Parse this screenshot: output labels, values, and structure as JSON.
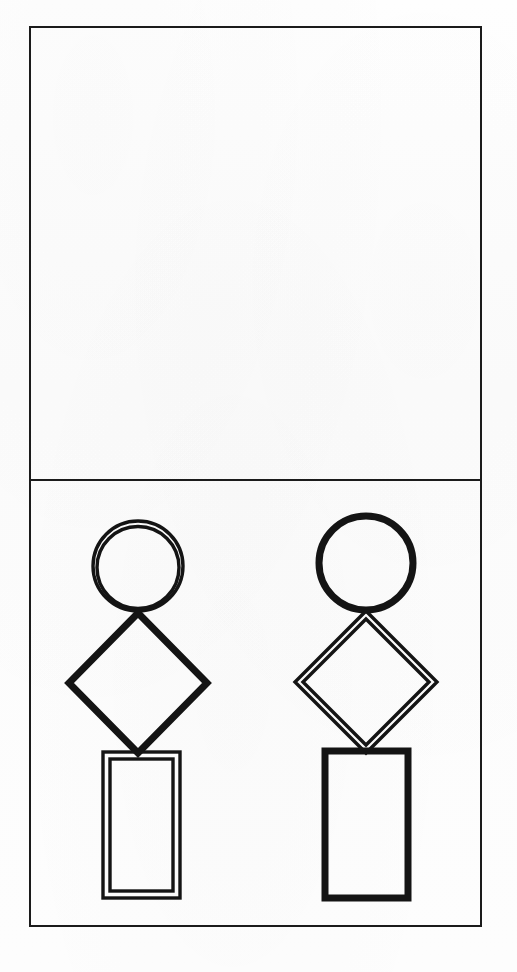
{
  "page": {
    "width": 517,
    "height": 972,
    "background_color": "#fdfdfd",
    "ink_color": "#141414",
    "frame_color": "#1b1b1b"
  },
  "frame": {
    "name": "outer-border",
    "x": 30,
    "y": 27,
    "width": 451,
    "height": 899,
    "stroke_width": 2
  },
  "divider": {
    "name": "horizontal-divider",
    "y": 480,
    "x_start": 30,
    "x_end": 481,
    "stroke_width": 2
  },
  "panels": [
    {
      "id": "top-panel",
      "label": "Top Panel",
      "x": 30,
      "y": 27,
      "width": 451,
      "height": 453,
      "content": "empty",
      "figures": []
    },
    {
      "id": "bottom-panel",
      "label": "Bottom Panel",
      "x": 30,
      "y": 480,
      "width": 451,
      "height": 446,
      "content": "two-figures",
      "figures": [
        "left-figure",
        "right-figure"
      ]
    }
  ],
  "figures": [
    {
      "id": "left-figure",
      "label": "Left Figure",
      "center_x": 138,
      "shapes": [
        {
          "id": "left-circle",
          "type": "circle",
          "label": "Circle",
          "outline": "double",
          "center_x": 138,
          "center_y": 566,
          "radius": 45,
          "inner_radius": 41,
          "stroke_width": 3.4
        },
        {
          "id": "left-diamond",
          "type": "diamond",
          "label": "Diamond",
          "outline": "single",
          "center_x": 138,
          "center_y": 683,
          "half_width": 69,
          "half_height": 70,
          "stroke_width": 7
        },
        {
          "id": "left-rectangle",
          "type": "rectangle",
          "label": "Rectangle",
          "outline": "double",
          "x": 103,
          "y": 752,
          "width": 77,
          "height": 146,
          "inset": 7,
          "stroke_width": 3.4
        }
      ]
    },
    {
      "id": "right-figure",
      "label": "Right Figure",
      "center_x": 366,
      "shapes": [
        {
          "id": "right-circle",
          "type": "circle",
          "label": "Circle",
          "outline": "single",
          "center_x": 366,
          "center_y": 563,
          "radius": 47,
          "stroke_width": 7
        },
        {
          "id": "right-diamond",
          "type": "diamond",
          "label": "Diamond",
          "outline": "double",
          "center_x": 366,
          "center_y": 682,
          "half_width": 71,
          "half_height": 71,
          "inner_half_width": 63,
          "inner_half_height": 63,
          "stroke_width": 3.4
        },
        {
          "id": "right-rectangle",
          "type": "rectangle",
          "label": "Rectangle",
          "outline": "single",
          "x": 325,
          "y": 751,
          "width": 83,
          "height": 147,
          "stroke_width": 7
        }
      ]
    }
  ]
}
